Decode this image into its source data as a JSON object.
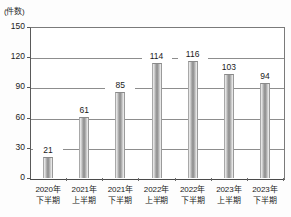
{
  "chart_data": {
    "type": "bar",
    "title": "",
    "subtitle": "",
    "xlabel": "",
    "ylabel": "(件数)",
    "ylim": [
      0,
      150
    ],
    "yticks": [
      0,
      30,
      60,
      90,
      120,
      150
    ],
    "grid": true,
    "legend": false,
    "categories": [
      "2020年\n下半期",
      "2021年\n上半期",
      "2021年\n下半期",
      "2022年\n上半期",
      "2022年\n下半期",
      "2023年\n上半期",
      "2023年\n下半期"
    ],
    "category_lines": [
      {
        "line1": "2020年",
        "line2": "下半期"
      },
      {
        "line1": "2021年",
        "line2": "上半期"
      },
      {
        "line1": "2021年",
        "line2": "下半期"
      },
      {
        "line1": "2022年",
        "line2": "上半期"
      },
      {
        "line1": "2022年",
        "line2": "下半期"
      },
      {
        "line1": "2023年",
        "line2": "上半期"
      },
      {
        "line1": "2023年",
        "line2": "下半期"
      }
    ],
    "values": [
      21,
      61,
      85,
      114,
      116,
      103,
      94
    ],
    "value_labels": [
      "21",
      "61",
      "85",
      "114",
      "116",
      "103",
      "94"
    ],
    "ytick_labels": [
      "150",
      "120",
      "90",
      "60",
      "30",
      "0"
    ],
    "bar_color": "#9d9d9d",
    "grid_color": "#8d8d8d",
    "axis_color": "#4a4a4a",
    "background_color": "#ffffff"
  }
}
